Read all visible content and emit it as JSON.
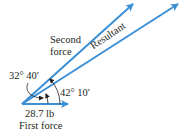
{
  "diagram": {
    "vectors": [
      {
        "name": "first-force",
        "label": "First force",
        "magnitude": "28.7 lb"
      },
      {
        "name": "second-force",
        "label_line1": "Second",
        "label_line2": "force"
      },
      {
        "name": "resultant",
        "label": "Resultant"
      }
    ],
    "angles": {
      "between_first_and_second": "32° 40′",
      "between_first_and_resultant": "42° 10′"
    },
    "colors": {
      "vector": "#3b8fd6",
      "text": "#231f20"
    }
  }
}
